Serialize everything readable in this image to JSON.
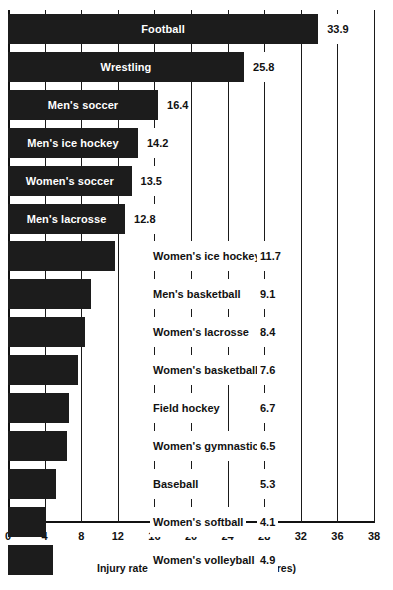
{
  "chart_data": {
    "type": "bar",
    "orientation": "horizontal",
    "title": "",
    "xlabel": "Injury rate (per 1,000 athlete-exposures)",
    "ylabel": "",
    "xlim": [
      0,
      38
    ],
    "grid": true,
    "legend": "none",
    "tick_labels": [
      "0",
      "4",
      "8",
      "12",
      "16",
      "20",
      "24",
      "28",
      "32",
      "36",
      "38"
    ],
    "tick_values": [
      0,
      4,
      8,
      12,
      16,
      20,
      24,
      28,
      32,
      36,
      38
    ],
    "axis_note": "final segment 36-38 is compressed/broken scale",
    "categories": [
      "Football",
      "Wrestling",
      "Men's soccer",
      "Men's ice hockey",
      "Women's soccer",
      "Men's lacrosse",
      "Women's ice hockey",
      "Men's basketball",
      "Women's lacrosse",
      "Women's basketball",
      "Field hockey",
      "Women's gymnastics",
      "Baseball",
      "Women's softball",
      "Women's volleyball"
    ],
    "values": [
      33.9,
      25.8,
      16.4,
      14.2,
      13.5,
      12.8,
      11.7,
      9.1,
      8.4,
      7.6,
      6.7,
      6.5,
      5.3,
      4.1,
      4.9
    ],
    "value_labels": [
      "33.9",
      "25.8",
      "16.4",
      "14.2",
      "13.5",
      "12.8",
      "11.7",
      "9.1",
      "8.4",
      "7.6",
      "6.7",
      "6.5",
      "5.3",
      "4.1",
      "4.9"
    ],
    "label_placement": [
      "inside",
      "inside",
      "inside",
      "inside",
      "inside",
      "inside",
      "outside",
      "outside",
      "outside",
      "outside",
      "outside",
      "outside",
      "outside",
      "outside",
      "outside"
    ],
    "bar_color": "#1c1c1c",
    "inside_label_color": "#ffffff",
    "outside_label_color": "#111111"
  }
}
